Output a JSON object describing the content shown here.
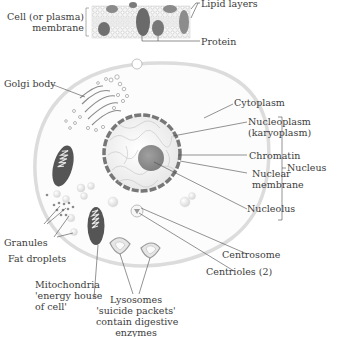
{
  "inset": {
    "name": "plasma membrane detail",
    "labels": {
      "cell_membrane": [
        "Cell (or plasma)",
        "membrane"
      ],
      "lipid_layers": "Lipid layers",
      "protein": "Protein"
    }
  },
  "labels": {
    "golgi_body": "Golgi body",
    "cytoplasm": "Cytoplasm",
    "nucleoplasm": [
      "Nucleoplasm",
      "(karyoplasm)"
    ],
    "chromatin": "Chromatin",
    "nuclear_membrane": [
      "Nuclear",
      "membrane"
    ],
    "nucleolus": "Nucleolus",
    "nucleus": "Nucleus",
    "centrosome": "Centrosome",
    "centrioles": "Centrioles (2)",
    "granules": "Granules",
    "fat_droplets": "Fat droplets",
    "mitochondria": [
      "Mitochondria",
      "'energy house",
      "of cell'"
    ],
    "lysosomes": [
      "Lysosomes",
      "'suicide packets'",
      "contain digestive",
      "enzymes"
    ]
  },
  "colors": {
    "cell_outline": "#d9d9d9",
    "cytoplasm": "#fbfbfb",
    "nucleus_fill": "#efefef",
    "nuclear_membrane": "#7a7a7a",
    "nucleolus": "#8e8e8e",
    "mitochondria": "#555555",
    "leader_line": "#4a4a4a"
  }
}
